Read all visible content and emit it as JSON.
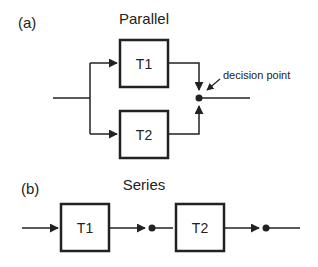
{
  "panel_a": {
    "label": "(a)",
    "title": "Parallel",
    "task1": "T1",
    "task2": "T2",
    "annotation": "decision point"
  },
  "panel_b": {
    "label": "(b)",
    "title": "Series",
    "task1": "T1",
    "task2": "T2"
  },
  "colors": {
    "stroke": "#222222",
    "background": "#ffffff"
  }
}
